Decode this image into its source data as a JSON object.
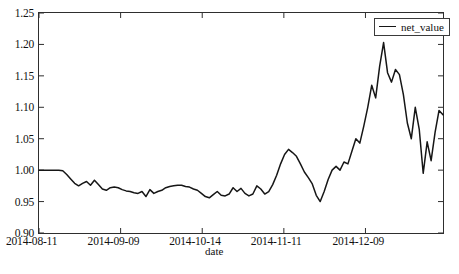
{
  "chart_data": {
    "type": "line",
    "title": "",
    "xlabel": "date",
    "ylabel": "",
    "legend": [
      "net_value"
    ],
    "legend_position": "top-right",
    "grid": false,
    "line_color": "#161616",
    "background_color": "#ffffff",
    "ylim": [
      0.9,
      1.25
    ],
    "yticks": [
      "0.90",
      "0.95",
      "1.00",
      "1.05",
      "1.10",
      "1.15",
      "1.20",
      "1.25"
    ],
    "ytick_values": [
      0.9,
      0.95,
      1.0,
      1.05,
      1.1,
      1.15,
      1.2,
      1.25
    ],
    "xticks": [
      "2014-08-11",
      "2014-09-09",
      "2014-10-14",
      "2014-11-11",
      "2014-12-09"
    ],
    "xtick_index": [
      0,
      20,
      40,
      60,
      80
    ],
    "xlim_index": [
      0,
      99
    ],
    "series": [
      {
        "name": "net_value",
        "values": [
          1.0,
          1.0,
          1.0,
          1.0,
          1.0,
          1.0,
          0.999,
          0.993,
          0.986,
          0.979,
          0.975,
          0.979,
          0.982,
          0.976,
          0.984,
          0.977,
          0.97,
          0.968,
          0.972,
          0.973,
          0.972,
          0.969,
          0.967,
          0.966,
          0.964,
          0.963,
          0.966,
          0.958,
          0.969,
          0.963,
          0.966,
          0.968,
          0.972,
          0.974,
          0.975,
          0.976,
          0.976,
          0.974,
          0.973,
          0.97,
          0.968,
          0.963,
          0.958,
          0.956,
          0.961,
          0.966,
          0.96,
          0.959,
          0.962,
          0.972,
          0.966,
          0.971,
          0.963,
          0.959,
          0.962,
          0.975,
          0.97,
          0.962,
          0.966,
          0.977,
          0.992,
          1.01,
          1.025,
          1.033,
          1.028,
          1.022,
          1.01,
          0.997,
          0.988,
          0.978,
          0.96,
          0.95,
          0.966,
          0.985,
          1.0,
          1.006,
          1.0,
          1.013,
          1.01,
          1.03,
          1.05,
          1.043,
          1.07,
          1.1,
          1.135,
          1.115,
          1.165,
          1.203,
          1.155,
          1.14,
          1.16,
          1.152,
          1.12,
          1.075,
          1.05,
          1.1,
          1.065,
          0.995,
          1.045,
          1.015,
          1.06,
          1.095,
          1.088
        ]
      }
    ]
  },
  "axes": {
    "x_axis_label": "date",
    "y_axis_label": ""
  },
  "legend": {
    "entries": [
      {
        "label": "net_value",
        "color": "#161616"
      }
    ]
  }
}
